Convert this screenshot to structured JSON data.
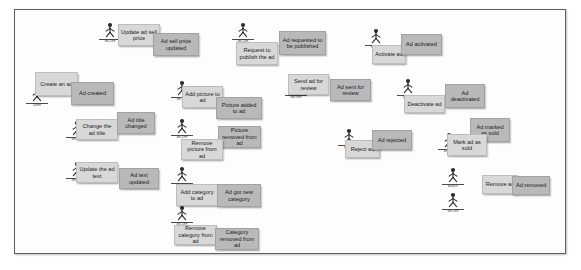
{
  "board": {
    "title": "Ad lifecycle event storming board",
    "background_color": "#ffffff",
    "frame_border_color": "#5d5d5d",
    "command_color": "#d8d8d8",
    "event_color": "#b9b9b9"
  },
  "legend": {
    "command_label": "command",
    "event_label": "event",
    "actor_label": "actor"
  },
  "actors": [
    {
      "id": "actor-update-sell-price",
      "role": "SELLER",
      "x": 95,
      "y": 22
    },
    {
      "id": "actor-request-publish",
      "role": "SELLER",
      "x": 228,
      "y": 22
    },
    {
      "id": "actor-activate-ad",
      "role": "ADMIN",
      "x": 361,
      "y": 28
    },
    {
      "id": "actor-create-ad",
      "role": "USER",
      "x": 22,
      "y": 86
    },
    {
      "id": "actor-add-picture",
      "role": "SELLER",
      "x": 167,
      "y": 80
    },
    {
      "id": "actor-send-for-review",
      "role": "SELLER",
      "x": 281,
      "y": 78
    },
    {
      "id": "actor-deactivate-ad",
      "role": "ADMIN",
      "x": 393,
      "y": 78
    },
    {
      "id": "actor-change-title",
      "role": "SELLER",
      "x": 62,
      "y": 120
    },
    {
      "id": "actor-remove-picture",
      "role": "SELLER",
      "x": 167,
      "y": 118
    },
    {
      "id": "actor-reject-ad",
      "role": "ADMIN",
      "x": 334,
      "y": 128
    },
    {
      "id": "actor-mark-sold",
      "role": "SELLER",
      "x": 434,
      "y": 132
    },
    {
      "id": "actor-update-text",
      "role": "SELLER",
      "x": 62,
      "y": 161
    },
    {
      "id": "actor-add-category",
      "role": "SELLER",
      "x": 167,
      "y": 166
    },
    {
      "id": "actor-remove-ad-admin",
      "role": "ADMIN",
      "x": 438,
      "y": 167
    },
    {
      "id": "actor-remove-category",
      "role": "SELLER",
      "x": 167,
      "y": 205
    },
    {
      "id": "actor-remove-ad-seller",
      "role": "SELLER",
      "x": 438,
      "y": 192
    }
  ],
  "notes": [
    {
      "id": "note-update-ad-sell-price",
      "kind": "command",
      "text": "Update ad sell price",
      "x": 118,
      "y": 24,
      "w": 42,
      "h": 22
    },
    {
      "id": "note-ad-sell-price-updated",
      "kind": "event",
      "text": "Ad sell price updated",
      "x": 153,
      "y": 33,
      "w": 46,
      "h": 23
    },
    {
      "id": "note-request-to-publish",
      "kind": "command",
      "text": "Request to publish the ad",
      "x": 236,
      "y": 42,
      "w": 42,
      "h": 23
    },
    {
      "id": "note-ad-requested-publish",
      "kind": "event",
      "text": "Ad requested to be published",
      "x": 279,
      "y": 31,
      "w": 47,
      "h": 24
    },
    {
      "id": "note-activate-ad",
      "kind": "command",
      "text": "Activate ad",
      "x": 372,
      "y": 45,
      "w": 34,
      "h": 19
    },
    {
      "id": "note-ad-activated",
      "kind": "event",
      "text": "Ad activated",
      "x": 401,
      "y": 34,
      "w": 41,
      "h": 21
    },
    {
      "id": "note-create-an-ad",
      "kind": "command",
      "text": "Create an ad",
      "x": 35,
      "y": 72,
      "w": 43,
      "h": 24
    },
    {
      "id": "note-ad-created",
      "kind": "event",
      "text": "Ad created",
      "x": 71,
      "y": 82,
      "w": 43,
      "h": 23
    },
    {
      "id": "note-add-picture-to-ad",
      "kind": "command",
      "text": "Add picture to ad",
      "x": 182,
      "y": 86,
      "w": 41,
      "h": 22
    },
    {
      "id": "note-picture-added-to-ad",
      "kind": "event",
      "text": "Picture added to ad",
      "x": 216,
      "y": 97,
      "w": 46,
      "h": 22
    },
    {
      "id": "note-send-ad-for-review",
      "kind": "command",
      "text": "Send ad for review",
      "x": 288,
      "y": 74,
      "w": 41,
      "h": 21
    },
    {
      "id": "note-ad-sent-for-review",
      "kind": "event",
      "text": "Ad sent for review",
      "x": 330,
      "y": 79,
      "w": 41,
      "h": 22
    },
    {
      "id": "note-deactivate-ad",
      "kind": "command",
      "text": "Deactivate ad",
      "x": 404,
      "y": 95,
      "w": 41,
      "h": 18
    },
    {
      "id": "note-ad-deactivated",
      "kind": "event",
      "text": "Ad deactivated",
      "x": 445,
      "y": 84,
      "w": 40,
      "h": 24
    },
    {
      "id": "note-change-the-ad-title",
      "kind": "command",
      "text": "Change the ad title",
      "x": 76,
      "y": 119,
      "w": 42,
      "h": 21
    },
    {
      "id": "note-ad-title-changed",
      "kind": "event",
      "text": "Ad title changed",
      "x": 117,
      "y": 112,
      "w": 38,
      "h": 22
    },
    {
      "id": "note-picture-removed",
      "kind": "event",
      "text": "Picture removed from ad",
      "x": 218,
      "y": 126,
      "w": 43,
      "h": 22
    },
    {
      "id": "note-remove-picture",
      "kind": "command",
      "text": "Remove picture from ad",
      "x": 181,
      "y": 139,
      "w": 42,
      "h": 21
    },
    {
      "id": "note-reject-ad",
      "kind": "command",
      "text": "Reject ad",
      "x": 345,
      "y": 140,
      "w": 35,
      "h": 18
    },
    {
      "id": "note-ad-rejected",
      "kind": "event",
      "text": "Ad rejected",
      "x": 372,
      "y": 130,
      "w": 40,
      "h": 20
    },
    {
      "id": "note-ad-marked-as-sold",
      "kind": "event",
      "text": "Ad marked as sold",
      "x": 470,
      "y": 118,
      "w": 40,
      "h": 24
    },
    {
      "id": "note-mark-ad-as-sold",
      "kind": "command",
      "text": "Mark ad as sold",
      "x": 447,
      "y": 134,
      "w": 40,
      "h": 22
    },
    {
      "id": "note-update-the-ad-text",
      "kind": "command",
      "text": "Update the ad text",
      "x": 76,
      "y": 162,
      "w": 42,
      "h": 21
    },
    {
      "id": "note-ad-text-updated",
      "kind": "event",
      "text": "Ad text updated",
      "x": 119,
      "y": 168,
      "w": 40,
      "h": 21
    },
    {
      "id": "note-add-category-to-ad",
      "kind": "command",
      "text": "Add category to ad",
      "x": 176,
      "y": 184,
      "w": 42,
      "h": 22
    },
    {
      "id": "note-ad-got-new-category",
      "kind": "event",
      "text": "Ad got new category",
      "x": 217,
      "y": 184,
      "w": 44,
      "h": 23
    },
    {
      "id": "note-remove-ad",
      "kind": "command",
      "text": "Remove ad",
      "x": 482,
      "y": 175,
      "w": 36,
      "h": 19
    },
    {
      "id": "note-ad-removed",
      "kind": "event",
      "text": "Ad removed",
      "x": 512,
      "y": 176,
      "w": 38,
      "h": 19
    },
    {
      "id": "note-remove-category",
      "kind": "command",
      "text": "Remove category from ad",
      "x": 174,
      "y": 225,
      "w": 43,
      "h": 20
    },
    {
      "id": "note-category-removed",
      "kind": "event",
      "text": "Category removed from ad",
      "x": 215,
      "y": 228,
      "w": 44,
      "h": 22
    }
  ]
}
